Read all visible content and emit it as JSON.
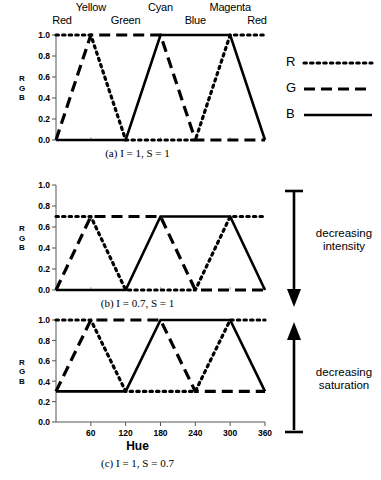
{
  "figure": {
    "axis": {
      "x_title": "Hue",
      "x_ticks": [
        60,
        120,
        180,
        240,
        300,
        360
      ],
      "x_min": 0,
      "x_max": 360,
      "y_ticks": [
        "1.0",
        "0.8",
        "0.6",
        "0.4",
        "0.2",
        "0.0"
      ],
      "y_min": 0,
      "y_max": 1.0,
      "y_label_letters": [
        "R",
        "G",
        "B"
      ]
    },
    "hue_labels": [
      {
        "text": "Red",
        "hue": 0,
        "row": "bottom"
      },
      {
        "text": "Yellow",
        "hue": 60,
        "row": "top"
      },
      {
        "text": "Green",
        "hue": 120,
        "row": "bottom"
      },
      {
        "text": "Cyan",
        "hue": 180,
        "row": "top"
      },
      {
        "text": "Blue",
        "hue": 240,
        "row": "bottom"
      },
      {
        "text": "Magenta",
        "hue": 300,
        "row": "top"
      },
      {
        "text": "Red",
        "hue": 360,
        "row": "bottom"
      }
    ],
    "legend": {
      "position": "right",
      "entries": [
        {
          "key": "R",
          "style": "dotted"
        },
        {
          "key": "G",
          "style": "dashed"
        },
        {
          "key": "B",
          "style": "solid"
        }
      ]
    },
    "annotations": [
      {
        "id": "decreasing-intensity",
        "line1": "decreasing",
        "line2": "intensity",
        "arrow": "down"
      },
      {
        "id": "decreasing-saturation",
        "line1": "decreasing",
        "line2": "saturation",
        "arrow": "up"
      }
    ],
    "captions": {
      "a": "(a) I = 1, S = 1",
      "b": "(b) I = 0.7, S = 1",
      "c": "(c) I = 1, S = 0.7"
    }
  },
  "chart_data": [
    {
      "id": "panel-a",
      "type": "line",
      "title": "(a) I = 1, S = 1",
      "xlabel": "Hue",
      "ylabel": "RGB",
      "xlim": [
        0,
        360
      ],
      "ylim": [
        0,
        1.0
      ],
      "xticks": [
        60,
        120,
        180,
        240,
        300,
        360
      ],
      "yticks": [
        0.0,
        0.2,
        0.4,
        0.6,
        0.8,
        1.0
      ],
      "grid": false,
      "legend_position": "right",
      "x": [
        0,
        60,
        120,
        180,
        240,
        300,
        360
      ],
      "series": [
        {
          "name": "R",
          "style": "dotted",
          "values": [
            1.0,
            1.0,
            0.0,
            0.0,
            0.0,
            1.0,
            1.0
          ]
        },
        {
          "name": "G",
          "style": "dashed",
          "values": [
            0.0,
            1.0,
            1.0,
            1.0,
            0.0,
            0.0,
            0.0
          ]
        },
        {
          "name": "B",
          "style": "solid",
          "values": [
            0.0,
            0.0,
            0.0,
            1.0,
            1.0,
            1.0,
            0.0
          ]
        }
      ]
    },
    {
      "id": "panel-b",
      "type": "line",
      "title": "(b) I = 0.7, S = 1",
      "xlabel": "Hue",
      "ylabel": "RGB",
      "xlim": [
        0,
        360
      ],
      "ylim": [
        0,
        1.0
      ],
      "xticks": [
        60,
        120,
        180,
        240,
        300,
        360
      ],
      "yticks": [
        0.0,
        0.2,
        0.4,
        0.6,
        0.8,
        1.0
      ],
      "grid": false,
      "x": [
        0,
        60,
        120,
        180,
        240,
        300,
        360
      ],
      "series": [
        {
          "name": "R",
          "style": "dotted",
          "values": [
            0.7,
            0.7,
            0.0,
            0.0,
            0.0,
            0.7,
            0.7
          ]
        },
        {
          "name": "G",
          "style": "dashed",
          "values": [
            0.0,
            0.7,
            0.7,
            0.7,
            0.0,
            0.0,
            0.0
          ]
        },
        {
          "name": "B",
          "style": "solid",
          "values": [
            0.0,
            0.0,
            0.0,
            0.7,
            0.7,
            0.7,
            0.0
          ]
        }
      ]
    },
    {
      "id": "panel-c",
      "type": "line",
      "title": "(c) I = 1, S = 0.7",
      "xlabel": "Hue",
      "ylabel": "RGB",
      "xlim": [
        0,
        360
      ],
      "ylim": [
        0,
        1.0
      ],
      "xticks": [
        60,
        120,
        180,
        240,
        300,
        360
      ],
      "yticks": [
        0.0,
        0.2,
        0.4,
        0.6,
        0.8,
        1.0
      ],
      "grid": false,
      "x": [
        0,
        60,
        120,
        180,
        240,
        300,
        360
      ],
      "series": [
        {
          "name": "R",
          "style": "dotted",
          "values": [
            1.0,
            1.0,
            0.3,
            0.3,
            0.3,
            1.0,
            1.0
          ]
        },
        {
          "name": "G",
          "style": "dashed",
          "values": [
            0.3,
            1.0,
            1.0,
            1.0,
            0.3,
            0.3,
            0.3
          ]
        },
        {
          "name": "B",
          "style": "solid",
          "values": [
            0.3,
            0.3,
            0.3,
            1.0,
            1.0,
            1.0,
            0.3
          ]
        }
      ]
    }
  ]
}
